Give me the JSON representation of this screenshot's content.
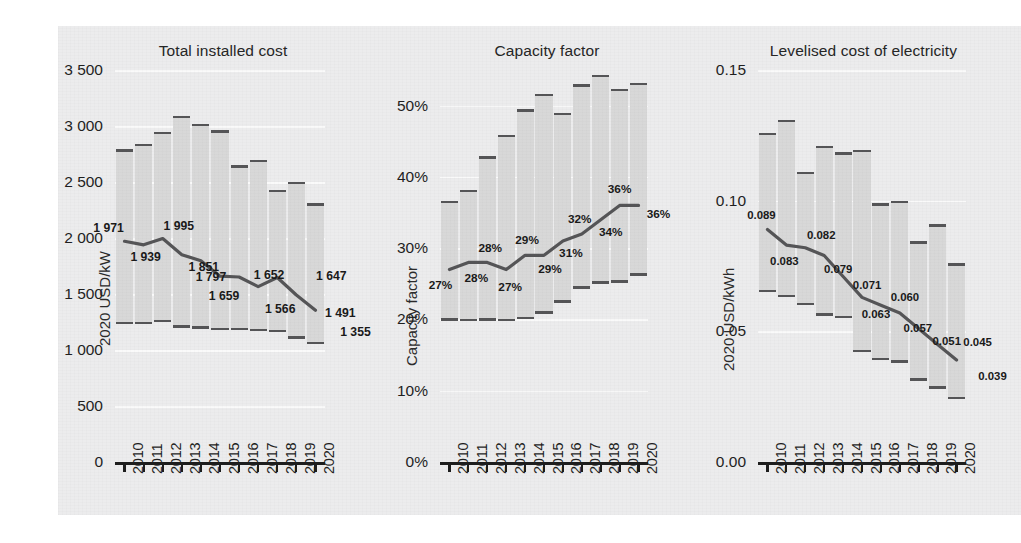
{
  "figure": {
    "background_color": "#ececed",
    "band_color": "#d8d8d8",
    "line_color": "#555557",
    "axis_color": "#1d1d1d"
  },
  "years": [
    "2010",
    "2011",
    "2012",
    "2013",
    "2014",
    "2015",
    "2016",
    "2017",
    "2018",
    "2019",
    "2020"
  ],
  "panels": [
    {
      "id": "total-installed-cost",
      "title": "Total installed cost",
      "ylabel": "2020 USD/kW",
      "yticks": [
        "0",
        "500",
        "1 000",
        "1 500",
        "2 000",
        "2 500",
        "3 000",
        "3 500"
      ],
      "ymin": 0,
      "ymax": 3500,
      "value_labels": [
        "1 971",
        "1 939",
        "1 995",
        "1 851",
        "1 797",
        "1 659",
        "1 652",
        "1 566",
        "1 647",
        "1 491",
        "1 355"
      ]
    },
    {
      "id": "capacity-factor",
      "title": "Capacity factor",
      "ylabel": "Capacity factor",
      "yticks": [
        "0%",
        "10%",
        "20%",
        "30%",
        "40%",
        "50%"
      ],
      "ymin": 0,
      "ymax": 55,
      "value_labels": [
        "27%",
        "28%",
        "28%",
        "27%",
        "29%",
        "29%",
        "31%",
        "32%",
        "34%",
        "36%",
        "36%"
      ]
    },
    {
      "id": "levelised-cost-of-electricity",
      "title": "Levelised cost of electricity",
      "ylabel": "2020 USD/kWh",
      "yticks": [
        "0.00",
        "0.05",
        "0.10",
        "0.15"
      ],
      "ymin": 0,
      "ymax": 0.15,
      "value_labels": [
        "0.089",
        "0.083",
        "0.082",
        "0.079",
        "0.071",
        "0.063",
        "0.060",
        "0.057",
        "0.051",
        "0.045",
        "0.039"
      ]
    }
  ],
  "chart_data": [
    {
      "type": "area",
      "title": "Total installed cost",
      "xlabel": "",
      "ylabel": "2020 USD/kW",
      "x": [
        "2010",
        "2011",
        "2012",
        "2013",
        "2014",
        "2015",
        "2016",
        "2017",
        "2018",
        "2019",
        "2020"
      ],
      "ylim": [
        0,
        3500
      ],
      "ytick_values": [
        0,
        500,
        1000,
        1500,
        2000,
        2500,
        3000,
        3500
      ],
      "grid": true,
      "legend": "none",
      "series": [
        {
          "name": "Weighted average",
          "values": [
            1971,
            1939,
            1995,
            1851,
            1797,
            1659,
            1652,
            1566,
            1647,
            1491,
            1355
          ]
        },
        {
          "name": "5th percentile (band low)",
          "values": [
            1240,
            1240,
            1260,
            1210,
            1200,
            1190,
            1190,
            1180,
            1170,
            1110,
            1060
          ]
        },
        {
          "name": "95th percentile (band high)",
          "values": [
            2780,
            2830,
            2940,
            3080,
            3010,
            2950,
            2640,
            2690,
            2420,
            2490,
            2300
          ]
        }
      ]
    },
    {
      "type": "area",
      "title": "Capacity factor",
      "xlabel": "",
      "ylabel": "Capacity factor",
      "x": [
        "2010",
        "2011",
        "2012",
        "2013",
        "2014",
        "2015",
        "2016",
        "2017",
        "2018",
        "2019",
        "2020"
      ],
      "ylim": [
        0,
        55
      ],
      "ytick_values": [
        0,
        10,
        20,
        30,
        40,
        50
      ],
      "grid": true,
      "legend": "none",
      "series": [
        {
          "name": "Weighted average",
          "values": [
            27,
            28,
            28,
            27,
            29,
            29,
            31,
            32,
            34,
            36,
            36
          ]
        },
        {
          "name": "5th percentile (band low)",
          "values": [
            20.0,
            19.9,
            20.0,
            19.9,
            20.2,
            21.0,
            22.5,
            24.5,
            25.2,
            25.3,
            26.3
          ]
        },
        {
          "name": "95th percentile (band high)",
          "values": [
            36.5,
            38.0,
            42.7,
            45.7,
            49.3,
            51.5,
            48.8,
            52.8,
            54.2,
            52.2,
            53.0
          ]
        }
      ]
    },
    {
      "type": "area",
      "title": "Levelised cost of electricity",
      "xlabel": "",
      "ylabel": "2020 USD/kWh",
      "x": [
        "2010",
        "2011",
        "2012",
        "2013",
        "2014",
        "2015",
        "2016",
        "2017",
        "2018",
        "2019",
        "2020"
      ],
      "ylim": [
        0,
        0.15
      ],
      "ytick_values": [
        0.0,
        0.05,
        0.1,
        0.15
      ],
      "grid": true,
      "legend": "none",
      "series": [
        {
          "name": "Weighted average",
          "values": [
            0.089,
            0.083,
            0.082,
            0.079,
            0.071,
            0.063,
            0.06,
            0.057,
            0.051,
            0.045,
            0.039
          ]
        },
        {
          "name": "5th percentile (band low)",
          "values": [
            0.0655,
            0.0635,
            0.0605,
            0.0565,
            0.0555,
            0.0425,
            0.0395,
            0.0385,
            0.0315,
            0.0285,
            0.0245
          ]
        },
        {
          "name": "95th percentile (band high)",
          "values": [
            0.1255,
            0.1305,
            0.1105,
            0.1205,
            0.118,
            0.119,
            0.0985,
            0.0995,
            0.084,
            0.0905,
            0.0755
          ]
        }
      ]
    }
  ]
}
